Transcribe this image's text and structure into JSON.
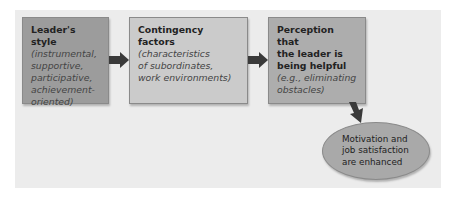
{
  "diagram": {
    "type": "flowchart",
    "nodes": [
      {
        "id": "leaders-style",
        "title": "Leader's style",
        "subtitle_lines": [
          "(instrumental,",
          "supportive,",
          "participative,",
          "achievement-",
          "oriented)"
        ],
        "color": "#9c9c9c"
      },
      {
        "id": "contingency-factors",
        "title": "Contingency factors",
        "subtitle_lines": [
          "(characteristics",
          "of subordinates,",
          "work environments)"
        ],
        "color": "#cbcbcb"
      },
      {
        "id": "perception-helpful",
        "title_lines": [
          "Perception that",
          "the leader is",
          "being helpful"
        ],
        "subtitle_lines": [
          "(e.g., eliminating",
          "obstacles)"
        ],
        "color": "#adadad"
      },
      {
        "id": "outcome",
        "shape": "ellipse",
        "lines": [
          "Motivation and",
          "job satisfaction",
          "are enhanced"
        ],
        "color": "#a9a9a9"
      }
    ],
    "edges": [
      {
        "from": "leaders-style",
        "to": "contingency-factors",
        "direction": "right"
      },
      {
        "from": "contingency-factors",
        "to": "perception-helpful",
        "direction": "right"
      },
      {
        "from": "perception-helpful",
        "to": "outcome",
        "direction": "down-right"
      }
    ],
    "colors": {
      "background_panel": "#ececec",
      "arrow": "#3a3a3a"
    }
  }
}
